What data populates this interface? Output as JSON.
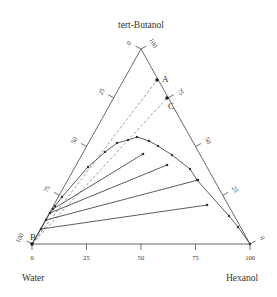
{
  "vertices": {
    "top": {
      "label": "tert-Butanol",
      "x": 141,
      "y": 49
    },
    "left": {
      "label": "Water",
      "x": 32,
      "y": 244
    },
    "right": {
      "label": "Hexanol",
      "x": 250,
      "y": 244
    }
  },
  "axis_ticks": {
    "bottom": [
      "0",
      "25",
      "50",
      "75",
      "100"
    ],
    "left": [
      "0",
      "25",
      "50",
      "75",
      "100"
    ],
    "right": [
      "100",
      "75",
      "50",
      "25",
      "0"
    ]
  },
  "point_labels": {
    "A": "A",
    "B": "B",
    "C": "C"
  },
  "colors": {
    "line": "#333333",
    "dashed": "#777777",
    "text": "#333333"
  },
  "binodal_curve_px": [
    [
      32,
      244
    ],
    [
      41,
      229
    ],
    [
      46,
      220
    ],
    [
      50,
      213
    ],
    [
      53,
      209
    ],
    [
      55,
      206
    ],
    [
      62,
      197
    ],
    [
      88,
      167
    ],
    [
      105,
      152
    ],
    [
      117,
      143
    ],
    [
      128,
      140
    ],
    [
      137,
      137
    ],
    [
      149,
      141
    ],
    [
      158,
      146
    ],
    [
      172,
      155
    ],
    [
      190,
      169
    ],
    [
      197,
      180
    ],
    [
      229,
      216
    ],
    [
      238,
      227
    ],
    [
      250,
      244
    ]
  ],
  "tie_lines_px": [
    [
      [
        41,
        229
      ],
      [
        207,
        205
      ]
    ],
    [
      [
        46,
        220
      ],
      [
        198,
        180
      ]
    ],
    [
      [
        50,
        213
      ],
      [
        167,
        165
      ]
    ],
    [
      [
        53,
        209
      ],
      [
        143,
        154
      ]
    ]
  ],
  "dashed_lines_px": [
    [
      [
        32,
        244
      ],
      [
        157,
        80
      ]
    ],
    [
      [
        32,
        244
      ],
      [
        167,
        98
      ]
    ]
  ],
  "key_points_px": {
    "A": [
      157,
      80
    ],
    "C": [
      167,
      98
    ],
    "B": [
      32,
      244
    ]
  }
}
